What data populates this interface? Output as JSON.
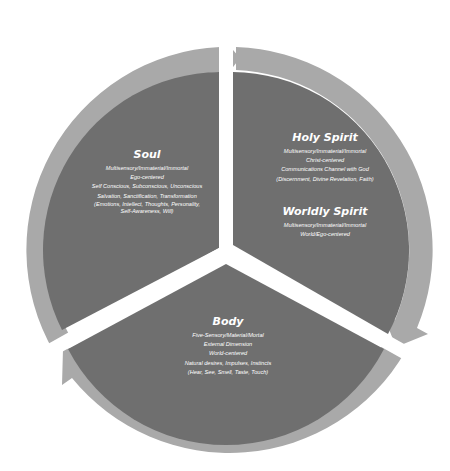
{
  "colors": {
    "ring": "#a9a9a9",
    "fill": "#6f6f6f",
    "gap": "#ffffff",
    "text": "#ffffff"
  },
  "segments": {
    "soul": {
      "title": "Soul",
      "lines": [
        "Multisensory/Immaterial/Immortal",
        "Ego-centered",
        "Self Conscious, Subconscious, Unconscious",
        "Salvation, Sanctification, Transformation",
        "(Emotions, Intellect, Thoughts, Personality,",
        "Self-Awareness, Will)"
      ]
    },
    "holy_spirit": {
      "title": "Holy Spirit",
      "lines": [
        "Multisensory/Immaterial/Immortal",
        "Christ-centered",
        "Communications Channel with God",
        "(Discernment, Divine Revelation, Faith)"
      ]
    },
    "worldly_spirit": {
      "title": "Worldly Spirit",
      "lines": [
        "Multisensory/Immaterial/Immortal",
        "World/Ego-centered"
      ]
    },
    "body": {
      "title": "Body",
      "lines": [
        "Five-Sensory/Material/Mortal",
        "External Dimension",
        "World-centered",
        "Natural desires, Impulses, Instincts",
        "(Hear, See, Smell, Taste, Touch)"
      ]
    }
  }
}
